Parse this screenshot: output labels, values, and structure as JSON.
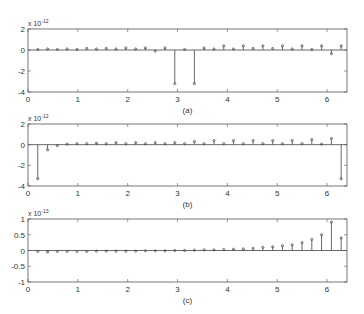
{
  "figure": {
    "width": 364,
    "height": 314,
    "axis_color": "#555555",
    "stem_color": "#444444"
  },
  "chart_data": [
    {
      "type": "stem",
      "caption": "(a)",
      "exponent_label": "x 10",
      "exponent_power": "-12",
      "xlim": [
        0,
        6.4
      ],
      "ylim": [
        -4,
        2
      ],
      "xticks": [
        0,
        1,
        2,
        3,
        4,
        5,
        6
      ],
      "yticks": [
        -4,
        -2,
        0,
        2
      ],
      "ytick_labels": [
        "-4",
        "-2",
        "0",
        "2"
      ],
      "x": [
        0.196,
        0.393,
        0.589,
        0.785,
        0.982,
        1.178,
        1.374,
        1.571,
        1.767,
        1.963,
        2.16,
        2.356,
        2.553,
        2.749,
        2.945,
        3.142,
        3.338,
        3.534,
        3.731,
        3.927,
        4.123,
        4.32,
        4.516,
        4.712,
        4.909,
        5.105,
        5.301,
        5.498,
        5.694,
        5.89,
        6.087,
        6.283
      ],
      "values": [
        0.05,
        0.1,
        0.05,
        0.1,
        0.05,
        0.15,
        0.1,
        0.15,
        0.1,
        0.2,
        0.1,
        0.2,
        -0.1,
        0.2,
        -3.2,
        0.05,
        -3.2,
        0.2,
        0.1,
        0.4,
        0.1,
        0.4,
        0.15,
        0.4,
        0.15,
        0.4,
        0.1,
        0.4,
        0.05,
        0.4,
        -0.35,
        0.4
      ],
      "grid": false
    },
    {
      "type": "stem",
      "caption": "(b)",
      "exponent_label": "x 10",
      "exponent_power": "-12",
      "xlim": [
        0,
        6.4
      ],
      "ylim": [
        -4,
        2
      ],
      "xticks": [
        0,
        1,
        2,
        3,
        4,
        5,
        6
      ],
      "yticks": [
        -4,
        -2,
        0,
        2
      ],
      "ytick_labels": [
        "-4",
        "-2",
        "0",
        "2"
      ],
      "x": [
        0.196,
        0.393,
        0.589,
        0.785,
        0.982,
        1.178,
        1.374,
        1.571,
        1.767,
        1.963,
        2.16,
        2.356,
        2.553,
        2.749,
        2.945,
        3.142,
        3.338,
        3.534,
        3.731,
        3.927,
        4.123,
        4.32,
        4.516,
        4.712,
        4.909,
        5.105,
        5.301,
        5.498,
        5.694,
        5.89,
        6.087,
        6.283
      ],
      "values": [
        -3.3,
        -0.5,
        -0.1,
        0.05,
        0.1,
        0.1,
        0.15,
        0.1,
        0.2,
        0.1,
        0.2,
        0.1,
        0.2,
        0.1,
        0.2,
        0.1,
        0.3,
        0.1,
        0.4,
        0.1,
        0.4,
        0.1,
        0.4,
        0.1,
        0.4,
        0.1,
        0.4,
        0.1,
        0.5,
        0.05,
        0.6,
        -3.3
      ],
      "grid": false
    },
    {
      "type": "stem",
      "caption": "(c)",
      "exponent_label": "x 10",
      "exponent_power": "-13",
      "xlim": [
        0,
        6.4
      ],
      "ylim": [
        -1,
        1
      ],
      "xticks": [
        0,
        1,
        2,
        3,
        4,
        5,
        6
      ],
      "yticks": [
        -1,
        -0.5,
        0,
        0.5,
        1
      ],
      "ytick_labels": [
        "-1",
        "-0.5",
        "0",
        "0.5",
        "1"
      ],
      "x": [
        0.196,
        0.393,
        0.589,
        0.785,
        0.982,
        1.178,
        1.374,
        1.571,
        1.767,
        1.963,
        2.16,
        2.356,
        2.553,
        2.749,
        2.945,
        3.142,
        3.338,
        3.534,
        3.731,
        3.927,
        4.123,
        4.32,
        4.516,
        4.712,
        4.909,
        5.105,
        5.301,
        5.498,
        5.694,
        5.89,
        6.087,
        6.283
      ],
      "values": [
        -0.03,
        -0.05,
        -0.03,
        -0.03,
        -0.03,
        -0.03,
        -0.02,
        -0.02,
        -0.02,
        -0.02,
        -0.02,
        -0.01,
        -0.01,
        -0.01,
        0.0,
        0.0,
        0.01,
        0.02,
        0.02,
        0.03,
        0.04,
        0.05,
        0.07,
        0.1,
        0.12,
        0.15,
        0.18,
        0.25,
        0.35,
        0.5,
        0.9,
        0.4
      ],
      "grid": false
    }
  ]
}
